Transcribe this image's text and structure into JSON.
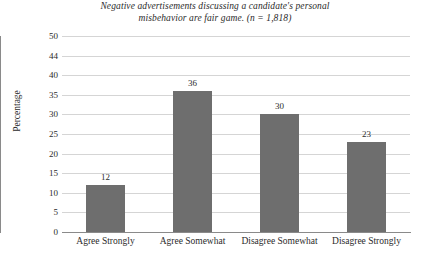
{
  "chart_data": {
    "type": "bar",
    "title": "Negative advertisements discussing a candidate's personal misbehavior are fair game. (n = 1,818)",
    "title_lines": [
      "Negative advertisements discussing a candidate's personal",
      "misbehavior are fair game. (n = 1,818)"
    ],
    "sample_size": "n = 1,818",
    "categories": [
      "Agree Strongly",
      "Agree Somewhat",
      "Disagree Somewhat",
      "Disagree Strongly"
    ],
    "values": [
      12,
      36,
      30,
      23
    ],
    "value_labels": [
      "12",
      "36",
      "30",
      "23"
    ],
    "xlabel": "",
    "ylabel": "Percentage",
    "ylim": [
      0,
      50
    ],
    "yticks": [
      0,
      5,
      10,
      15,
      20,
      25,
      30,
      35,
      40,
      45,
      50
    ],
    "ytick_labels": [
      "0",
      "5",
      "10",
      "15",
      "20",
      "25",
      "30",
      "35",
      "40",
      "44",
      "50"
    ],
    "grid": true,
    "legend": false,
    "bar_color": "#6e6e6e",
    "gridline_color": "#d5d5d5",
    "axis_color": "#8a8a8a",
    "background_color": "#ffffff"
  }
}
